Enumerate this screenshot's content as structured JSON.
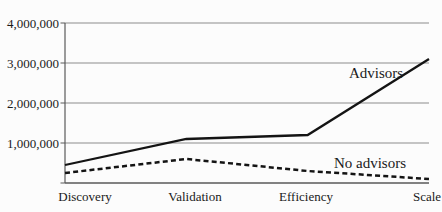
{
  "chart_data": {
    "type": "line",
    "title": "",
    "xlabel": "",
    "ylabel": "",
    "categories": [
      "Discovery",
      "Validation",
      "Efficiency",
      "Scale"
    ],
    "series": [
      {
        "name": "Advisors",
        "style": "solid",
        "values": [
          450000,
          1100000,
          1200000,
          3100000
        ]
      },
      {
        "name": "No advisors",
        "style": "dashed",
        "values": [
          250000,
          600000,
          300000,
          100000
        ]
      }
    ],
    "annotations": [
      {
        "text": "Advisors"
      },
      {
        "text": "No advisors"
      }
    ],
    "ylim": [
      0,
      4000000
    ],
    "yticks": [
      1000000,
      2000000,
      3000000,
      4000000
    ],
    "ytick_labels": [
      "1,000,000",
      "2,000,000",
      "3,000,000",
      "4,000,000"
    ],
    "grid": true,
    "legend": "inline-annotations",
    "colors": {
      "line": "#141414",
      "gridline": "#8c8c8c",
      "axis": "#5a5a5a",
      "text": "#1a1a1a",
      "background": "#fcfcfc"
    }
  }
}
